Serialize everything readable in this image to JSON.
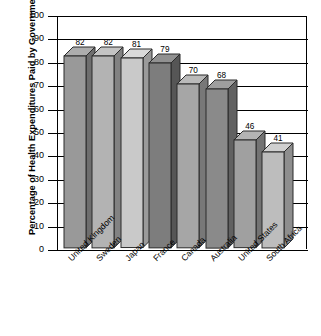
{
  "chart_data": {
    "type": "bar",
    "title": "",
    "subtitle": "",
    "xlabel": "",
    "ylabel": "Percentage of Health Expenditures Paid by Government",
    "ylim": [
      0,
      100
    ],
    "yticks": [
      0,
      10,
      20,
      30,
      40,
      50,
      60,
      70,
      80,
      90,
      100
    ],
    "ytick_labels": [
      "0",
      "10",
      "20",
      "30",
      "40",
      "50",
      "60",
      "70",
      "80",
      "90",
      "100"
    ],
    "grid": true,
    "grid_axis": "y",
    "legend": false,
    "legend_position": "none",
    "three_d": true,
    "categories": [
      "United Kingdom",
      "Sweden",
      "Japan",
      "France",
      "Canada",
      "Australia",
      "United States",
      "South Africa"
    ],
    "values": [
      82,
      82,
      81,
      79,
      70,
      68,
      46,
      41
    ],
    "value_labels": [
      "82",
      "82",
      "81",
      "79",
      "70",
      "68",
      "46",
      "41"
    ],
    "bar_colors": [
      "#999999",
      "#b3b3b3",
      "#c9c9c9",
      "#7d7d7d",
      "#a6a6a6",
      "#8a8a8a",
      "#a0a0a0",
      "#bdbdbd"
    ],
    "bar_side_colors": [
      "#6e6e6e",
      "#828282",
      "#9a9a9a",
      "#565656",
      "#787878",
      "#616161",
      "#737373",
      "#8e8e8e"
    ],
    "bar_top_colors": [
      "#adadad",
      "#c4c4c4",
      "#dadada",
      "#919191",
      "#bababa",
      "#9e9e9e",
      "#b4b4b4",
      "#d0d0d0"
    ],
    "axis_color": "#000000",
    "background_color": "#ffffff",
    "outline_color": "#2b2b2b"
  }
}
